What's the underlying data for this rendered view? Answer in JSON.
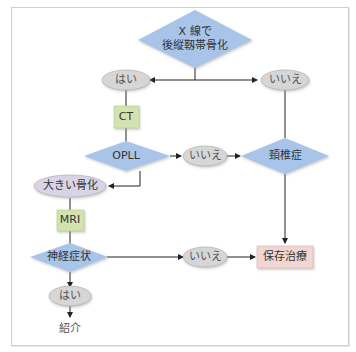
{
  "colors": {
    "diamond": "#a8c4e8",
    "oval": "#d6d6d6",
    "oval_purple": "#d8d4e6",
    "box_green": "#d3e3b0",
    "box_pink": "#f1d6d2",
    "line": "#222222",
    "frame": "#cfcfcf"
  },
  "nodes": {
    "xray": {
      "line1": "X 線で",
      "line2": "後縦靱帯骨化"
    },
    "yes_top": "はい",
    "no_top": "いいえ",
    "ct": "CT",
    "opll": "OPLL",
    "no_opll": "いいえ",
    "spondylosis": "頚椎症",
    "large_ossification": "大きい骨化",
    "mri": "MRI",
    "neuro": "神経症状",
    "no_neuro": "いいえ",
    "conservative": "保存治療",
    "yes_neuro": "はい",
    "referral": "紹介"
  }
}
